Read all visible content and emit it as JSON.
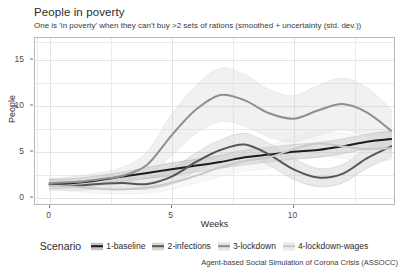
{
  "chart_data": {
    "type": "line",
    "title": "People in poverty",
    "subtitle": "One is 'in poverty' when they can't buy >2 sets of rations (smoothed + uncertainty (std. dev.))",
    "xlabel": "Weeks",
    "ylabel": "People",
    "xlim": [
      -0.6,
      14.2
    ],
    "ylim": [
      -0.9,
      17.4
    ],
    "xticks": [
      0,
      5,
      10
    ],
    "yticks": [
      0,
      5,
      10,
      15
    ],
    "grid": true,
    "legend_position": "bottom",
    "legend_title": "Scenario",
    "footnote": "Agent-based Social Simulation of Corona Crisis (ASSOCC)",
    "x": [
      0,
      1,
      2,
      3,
      4,
      5,
      6,
      7,
      8,
      9,
      10,
      11,
      12,
      13,
      14
    ],
    "series": [
      {
        "name": "1-baseline",
        "color": "#1c1c1c",
        "band_color": "#9a9a9a",
        "values": [
          1.5,
          1.6,
          1.9,
          2.3,
          2.7,
          3.1,
          3.5,
          3.9,
          4.4,
          4.7,
          5.0,
          5.2,
          5.6,
          6.1,
          6.4
        ],
        "band_lower": [
          1.0,
          1.1,
          1.4,
          1.8,
          2.1,
          2.4,
          2.8,
          3.2,
          3.6,
          3.9,
          4.2,
          4.4,
          4.8,
          5.3,
          5.5
        ],
        "band_upper": [
          2.0,
          2.1,
          2.4,
          2.8,
          3.3,
          3.8,
          4.2,
          4.6,
          5.2,
          5.5,
          5.8,
          6.0,
          6.4,
          6.9,
          7.3
        ]
      },
      {
        "name": "2-infections",
        "color": "#565656",
        "band_color": "#bdbdbd",
        "values": [
          1.4,
          1.3,
          1.5,
          1.6,
          1.5,
          2.3,
          3.9,
          5.2,
          5.8,
          4.7,
          3.1,
          2.2,
          2.6,
          4.3,
          5.6
        ],
        "band_lower": [
          0.9,
          0.8,
          0.9,
          1.0,
          0.9,
          1.5,
          2.9,
          4.1,
          4.6,
          3.5,
          2.0,
          1.2,
          1.6,
          3.2,
          4.4
        ],
        "band_upper": [
          1.9,
          1.8,
          2.0,
          2.2,
          2.2,
          3.1,
          4.9,
          6.3,
          7.0,
          5.9,
          4.3,
          3.2,
          3.6,
          5.4,
          6.8
        ]
      },
      {
        "name": "3-lockdown",
        "color": "#8f8f8f",
        "band_color": "#d4d4d4",
        "values": [
          1.6,
          1.7,
          2.0,
          2.4,
          3.6,
          6.8,
          9.6,
          11.2,
          10.6,
          9.2,
          8.6,
          9.5,
          10.2,
          9.3,
          7.3
        ],
        "band_lower": [
          1.1,
          1.1,
          1.3,
          1.6,
          2.3,
          4.6,
          7.0,
          8.3,
          7.8,
          6.6,
          6.1,
          6.8,
          7.4,
          6.6,
          5.0
        ],
        "band_upper": [
          2.1,
          2.3,
          2.7,
          3.3,
          5.0,
          9.1,
          12.2,
          14.1,
          13.4,
          11.8,
          11.1,
          12.2,
          13.0,
          12.0,
          9.6
        ]
      },
      {
        "name": "4-lockdown-wages",
        "color": "#c9c9c9",
        "band_color": "#e6e6e6",
        "values": [
          1.3,
          1.2,
          1.0,
          0.9,
          1.1,
          1.6,
          2.4,
          3.3,
          4.0,
          4.4,
          5.3,
          5.9,
          5.6,
          5.3,
          5.4
        ],
        "band_lower": [
          0.8,
          0.7,
          0.5,
          0.4,
          0.5,
          0.9,
          1.6,
          2.3,
          2.9,
          3.2,
          4.1,
          4.6,
          4.3,
          4.0,
          4.1
        ],
        "band_upper": [
          1.8,
          1.7,
          1.5,
          1.5,
          1.8,
          2.4,
          3.3,
          4.4,
          5.2,
          5.7,
          6.6,
          7.3,
          7.0,
          6.7,
          6.8
        ]
      }
    ]
  }
}
